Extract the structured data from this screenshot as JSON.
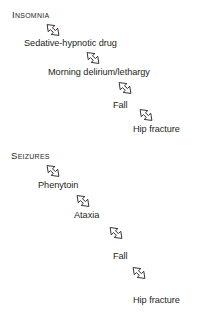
{
  "diagram": {
    "background_color": "#ffffff",
    "text_color": "#241f20",
    "arrow_icon_name": "block-arrow-down-right-icon",
    "cascades": [
      {
        "id": "insomnia-cascade",
        "steps": [
          {
            "label": "Insomnia",
            "style": "small-caps",
            "x": 12,
            "y": 9
          },
          {
            "label": "Sedative-hypnotic drug",
            "style": "normal",
            "x": 24,
            "y": 38
          },
          {
            "label": "Morning delirium/lethargy",
            "style": "normal",
            "x": 48,
            "y": 67
          },
          {
            "label": "Fall",
            "style": "normal",
            "x": 113,
            "y": 100
          },
          {
            "label": "Hip fracture",
            "style": "normal",
            "x": 133,
            "y": 124
          }
        ],
        "arrows": [
          {
            "x": 40,
            "y": 18
          },
          {
            "x": 80,
            "y": 46
          },
          {
            "x": 112,
            "y": 76
          },
          {
            "x": 133,
            "y": 103
          }
        ]
      },
      {
        "id": "seizures-cascade",
        "steps": [
          {
            "label": "Seizures",
            "style": "small-caps",
            "x": 11,
            "y": 150
          },
          {
            "label": "Phenytoin",
            "style": "normal",
            "x": 38,
            "y": 180
          },
          {
            "label": "Ataxia",
            "style": "normal",
            "x": 74,
            "y": 210
          },
          {
            "label": "Fall",
            "style": "normal",
            "x": 113,
            "y": 251
          },
          {
            "label": "Hip fracture",
            "style": "normal",
            "x": 133,
            "y": 295
          }
        ],
        "arrows": [
          {
            "x": 40,
            "y": 159
          },
          {
            "x": 70,
            "y": 189
          },
          {
            "x": 103,
            "y": 221
          },
          {
            "x": 126,
            "y": 261
          }
        ]
      }
    ]
  }
}
